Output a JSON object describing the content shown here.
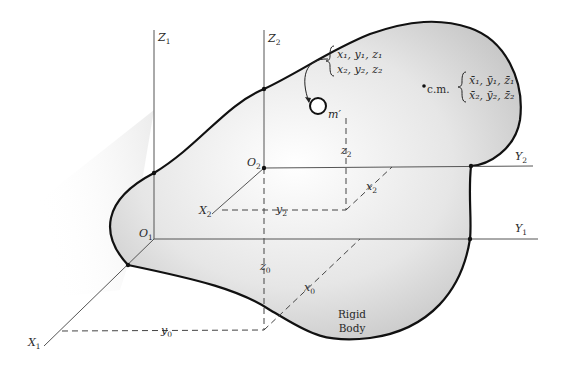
{
  "figure": {
    "type": "rigid-body coordinate frames diagram",
    "body_label": [
      "Rigid",
      "Body"
    ],
    "frame1": {
      "origin": {
        "name": "O",
        "sub": "1"
      },
      "axes": [
        {
          "name": "X",
          "sub": "1"
        },
        {
          "name": "Y",
          "sub": "1"
        },
        {
          "name": "Z",
          "sub": "1"
        }
      ]
    },
    "frame2": {
      "origin": {
        "name": "O",
        "sub": "2"
      },
      "axes": [
        {
          "name": "X",
          "sub": "2"
        },
        {
          "name": "Y",
          "sub": "2"
        },
        {
          "name": "Z",
          "sub": "2"
        }
      ]
    },
    "offsets": {
      "x0": {
        "name": "x",
        "sub": "0"
      },
      "y0": {
        "name": "y",
        "sub": "0"
      },
      "z0": {
        "name": "z",
        "sub": "0"
      }
    },
    "mass_point": {
      "label": "m′",
      "coords_line1": "x₁, y₁, z₁",
      "coords_line2": "x₂, y₂, z₂",
      "x2": {
        "name": "x",
        "sub": "2"
      },
      "y2": {
        "name": "y",
        "sub": "2"
      },
      "z2": {
        "name": "z",
        "sub": "2"
      }
    },
    "center_of_mass": {
      "label": "c.m.",
      "coords_line1": "x̄₁, ȳ₁, z̄₁",
      "coords_line2": "x̄₂, ȳ₂, z̄₂"
    }
  }
}
